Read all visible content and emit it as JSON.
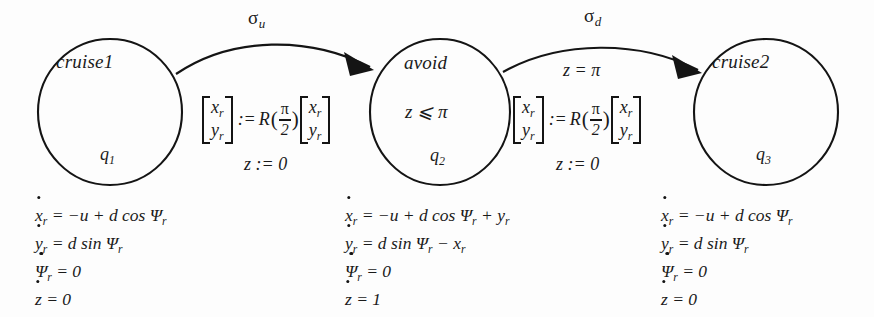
{
  "diagram": {
    "type": "hybrid-automaton",
    "title": "",
    "ink_color": "#141414",
    "background_color": "#fdfdfd",
    "states": [
      {
        "id": "q1",
        "name": "cruise1",
        "q_label": "q",
        "q_sub": "1",
        "invariant": "",
        "cx": 110,
        "cy": 112,
        "rx": 72,
        "ry": 73
      },
      {
        "id": "q2",
        "name": "avoid",
        "q_label": "q",
        "q_sub": "2",
        "invariant": "z ⩽ π",
        "cx": 440,
        "cy": 112,
        "rx": 70,
        "ry": 73
      },
      {
        "id": "q3",
        "name": "cruise2",
        "q_label": "q",
        "q_sub": "3",
        "invariant": "",
        "cx": 766,
        "cy": 112,
        "rx": 72,
        "ry": 73
      }
    ],
    "transitions": [
      {
        "id": "t1",
        "from": "q1",
        "to": "q2",
        "event": "σ",
        "event_sub": "u",
        "guard": "",
        "reset_lhs_top": "x",
        "reset_lhs_top_sub": "r",
        "reset_lhs_bot": "y",
        "reset_lhs_bot_sub": "r",
        "reset_assign": ":=",
        "reset_fn": "R",
        "reset_fn_num": "π",
        "reset_fn_den": "2",
        "reset_rhs_top": "x",
        "reset_rhs_top_sub": "r",
        "reset_rhs_bot": "y",
        "reset_rhs_bot_sub": "r",
        "reset_z": "z := 0",
        "path": "M 176 74 C 232 36 310 36 372 66",
        "arrow_points": "372,66 350,55 353,75"
      },
      {
        "id": "t2",
        "from": "q2",
        "to": "q3",
        "event": "σ",
        "event_sub": "d",
        "guard": "z = π",
        "reset_lhs_top": "x",
        "reset_lhs_top_sub": "r",
        "reset_lhs_bot": "y",
        "reset_lhs_bot_sub": "r",
        "reset_assign": ":=",
        "reset_fn": "R",
        "reset_fn_num": "π",
        "reset_fn_den": "2",
        "reset_rhs_top": "x",
        "reset_rhs_top_sub": "r",
        "reset_rhs_bot": "y",
        "reset_rhs_bot_sub": "r",
        "reset_z": "z := 0",
        "path": "M 503 72 C 560 40 640 40 700 69",
        "arrow_points": "700,69 678,58 681,78"
      }
    ],
    "dynamics": [
      {
        "state_id": "q1",
        "x": 35,
        "y": 201,
        "lines": [
          {
            "var": "x",
            "var_sub": "r",
            "rhs": "= −u + d cos Ψ",
            "rhs_sub": "r"
          },
          {
            "var": "y",
            "var_sub": "r",
            "rhs": "= d sin Ψ",
            "rhs_sub": "r"
          },
          {
            "var": "Ψ",
            "var_sub": "r",
            "rhs": "= 0",
            "rhs_sub": ""
          },
          {
            "var": "z",
            "var_sub": "",
            "rhs": "= 0",
            "rhs_sub": ""
          }
        ]
      },
      {
        "state_id": "q2",
        "x": 345,
        "y": 201,
        "lines": [
          {
            "var": "x",
            "var_sub": "r",
            "rhs": "= −u + d cos Ψ",
            "rhs_sub": "r",
            "rhs_tail": "+ y",
            "rhs_tail_sub": "r"
          },
          {
            "var": "y",
            "var_sub": "r",
            "rhs": "= d sin Ψ",
            "rhs_sub": "r",
            "rhs_tail": "− x",
            "rhs_tail_sub": "r"
          },
          {
            "var": "Ψ",
            "var_sub": "r",
            "rhs": "= 0",
            "rhs_sub": ""
          },
          {
            "var": "z",
            "var_sub": "",
            "rhs": "= 1",
            "rhs_sub": ""
          }
        ]
      },
      {
        "state_id": "q3",
        "x": 661,
        "y": 201,
        "lines": [
          {
            "var": "x",
            "var_sub": "r",
            "rhs": "= −u + d cos Ψ",
            "rhs_sub": "r"
          },
          {
            "var": "y",
            "var_sub": "r",
            "rhs": "= d sin Ψ",
            "rhs_sub": "r"
          },
          {
            "var": "Ψ",
            "var_sub": "r",
            "rhs": "= 0",
            "rhs_sub": ""
          },
          {
            "var": "z",
            "var_sub": "",
            "rhs": "= 0",
            "rhs_sub": ""
          }
        ]
      }
    ]
  }
}
